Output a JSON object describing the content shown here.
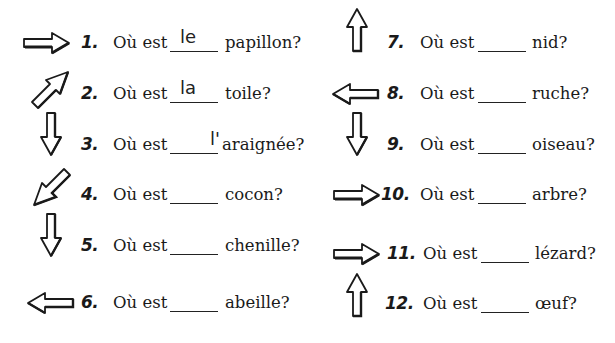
{
  "worksheet": {
    "prompt": "Où est",
    "items": [
      {
        "number": "1.",
        "answer": "le",
        "noun": "papillon?",
        "arrow": "right"
      },
      {
        "number": "2.",
        "answer": "la",
        "noun": "toile?",
        "arrow": "up-right"
      },
      {
        "number": "3.",
        "answer": "l'",
        "noun": "araignée?",
        "arrow": "down"
      },
      {
        "number": "4.",
        "answer": "",
        "noun": "cocon?",
        "arrow": "down-left"
      },
      {
        "number": "5.",
        "answer": "",
        "noun": "chenille?",
        "arrow": "down"
      },
      {
        "number": "6.",
        "answer": "",
        "noun": "abeille?",
        "arrow": "left"
      },
      {
        "number": "7.",
        "answer": "",
        "noun": "nid?",
        "arrow": "up"
      },
      {
        "number": "8.",
        "answer": "",
        "noun": "ruche?",
        "arrow": "left"
      },
      {
        "number": "9.",
        "answer": "",
        "noun": "oiseau?",
        "arrow": "down"
      },
      {
        "number": "10.",
        "answer": "",
        "noun": "arbre?",
        "arrow": "right"
      },
      {
        "number": "11.",
        "answer": "",
        "noun": "lézard?",
        "arrow": "right"
      },
      {
        "number": "12.",
        "answer": "",
        "noun": "œuf?",
        "arrow": "up"
      }
    ]
  }
}
